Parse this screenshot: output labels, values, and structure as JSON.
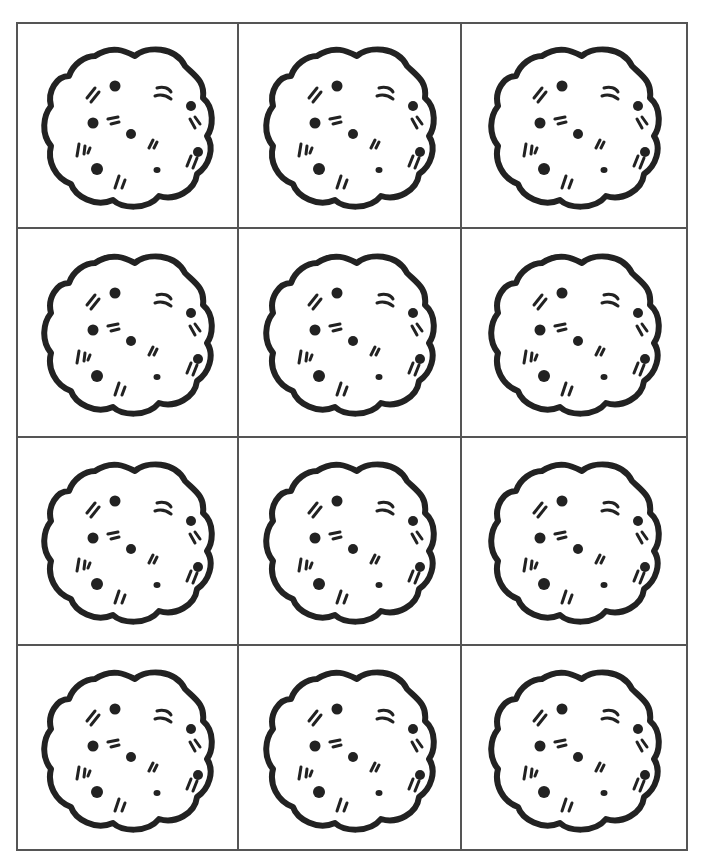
{
  "sheet": {
    "title": "",
    "columns": 3,
    "rows": 4,
    "cells": [
      {
        "item": "cookie"
      },
      {
        "item": "cookie"
      },
      {
        "item": "cookie"
      },
      {
        "item": "cookie"
      },
      {
        "item": "cookie"
      },
      {
        "item": "cookie"
      },
      {
        "item": "cookie"
      },
      {
        "item": "cookie"
      },
      {
        "item": "cookie"
      },
      {
        "item": "cookie"
      },
      {
        "item": "cookie"
      },
      {
        "item": "cookie"
      }
    ],
    "colors": {
      "ink": "#222222",
      "grid": "#555555",
      "paper": "#ffffff"
    }
  }
}
